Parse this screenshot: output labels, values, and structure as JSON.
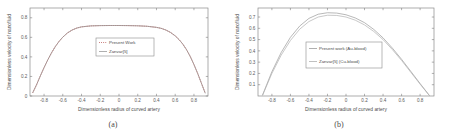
{
  "figure": {
    "panels": [
      {
        "caption": "(a)",
        "xlabel": "Dimensionless radius of curved artery",
        "ylabel": "Dimensionless velocity of nanofluid",
        "xticks": [
          "-0.8",
          "-0.6",
          "-0.4",
          "-0.2",
          "0",
          "0.2",
          "0.4",
          "0.6",
          "0.8"
        ],
        "yticks": [
          "0",
          "0.2",
          "0.4",
          "0.6",
          "0.8"
        ],
        "legend": [
          {
            "label": "Present Work",
            "color": "#b5524f",
            "style": "dotted"
          },
          {
            "label": "Zanvar[5]",
            "color": "#9a9a9a",
            "style": "solid"
          }
        ]
      },
      {
        "caption": "(b)",
        "xlabel": "Dimensionless radius of curved artery",
        "ylabel": "Dimensionless velocity of nanofluid",
        "xticks": [
          "-0.8",
          "-0.6",
          "-0.4",
          "-0.2",
          "0",
          "0.2",
          "0.4",
          "0.6",
          "0.8"
        ],
        "yticks": [
          "0.1",
          "0.2",
          "0.3",
          "0.4",
          "0.5",
          "0.6",
          "0.7"
        ],
        "legend": [
          {
            "label": "Present work (Au-blood)",
            "color": "#9a9a9a",
            "style": "solid"
          },
          {
            "label": "Zanvar[5] (Cu-blood)",
            "color": "#b0b0b0",
            "style": "solid"
          }
        ]
      }
    ]
  },
  "chart_data": [
    {
      "type": "line",
      "title": "",
      "subtitle": "(a)",
      "xlabel": "Dimensionless radius of curved artery",
      "ylabel": "Dimensionless velocity of nanofluid",
      "xlim": [
        -0.95,
        0.95
      ],
      "ylim": [
        0,
        0.9
      ],
      "xticks": [
        -0.8,
        -0.6,
        -0.4,
        -0.2,
        0,
        0.2,
        0.4,
        0.6,
        0.8
      ],
      "yticks": [
        0,
        0.2,
        0.4,
        0.6,
        0.8
      ],
      "grid": false,
      "legend_position": "center",
      "series": [
        {
          "name": "Present Work",
          "color": "#b5524f",
          "linestyle": "dotted",
          "x": [
            -0.92,
            -0.88,
            -0.84,
            -0.8,
            -0.76,
            -0.72,
            -0.68,
            -0.64,
            -0.6,
            -0.55,
            -0.5,
            -0.45,
            -0.4,
            -0.3,
            -0.2,
            -0.1,
            0.0,
            0.1,
            0.2,
            0.3,
            0.4,
            0.45,
            0.5,
            0.55,
            0.6,
            0.64,
            0.68,
            0.72,
            0.76,
            0.8,
            0.84,
            0.88,
            0.92
          ],
          "y": [
            0.035,
            0.115,
            0.205,
            0.29,
            0.37,
            0.442,
            0.505,
            0.558,
            0.602,
            0.645,
            0.675,
            0.695,
            0.707,
            0.717,
            0.72,
            0.721,
            0.721,
            0.72,
            0.718,
            0.713,
            0.702,
            0.692,
            0.675,
            0.65,
            0.615,
            0.578,
            0.532,
            0.475,
            0.405,
            0.322,
            0.23,
            0.13,
            0.03
          ]
        },
        {
          "name": "Zanvar[5]",
          "color": "#9a9a9a",
          "linestyle": "solid",
          "x": [
            -0.92,
            -0.88,
            -0.84,
            -0.8,
            -0.76,
            -0.72,
            -0.68,
            -0.64,
            -0.6,
            -0.55,
            -0.5,
            -0.45,
            -0.4,
            -0.3,
            -0.2,
            -0.1,
            0.0,
            0.1,
            0.2,
            0.3,
            0.4,
            0.45,
            0.5,
            0.55,
            0.6,
            0.64,
            0.68,
            0.72,
            0.76,
            0.8,
            0.84,
            0.88,
            0.92
          ],
          "y": [
            0.035,
            0.115,
            0.205,
            0.29,
            0.37,
            0.442,
            0.505,
            0.558,
            0.602,
            0.645,
            0.675,
            0.695,
            0.707,
            0.717,
            0.72,
            0.721,
            0.721,
            0.72,
            0.718,
            0.713,
            0.702,
            0.692,
            0.675,
            0.65,
            0.615,
            0.578,
            0.532,
            0.475,
            0.405,
            0.322,
            0.23,
            0.13,
            0.03
          ]
        }
      ]
    },
    {
      "type": "line",
      "title": "",
      "subtitle": "(b)",
      "xlabel": "Dimensionless radius of curved artery",
      "ylabel": "Dimensionless velocity of nanofluid",
      "xlim": [
        -0.95,
        0.95
      ],
      "ylim": [
        0,
        0.78
      ],
      "xticks": [
        -0.8,
        -0.6,
        -0.4,
        -0.2,
        0,
        0.2,
        0.4,
        0.6,
        0.8
      ],
      "yticks": [
        0.1,
        0.2,
        0.3,
        0.4,
        0.5,
        0.6,
        0.7
      ],
      "grid": false,
      "legend_position": "center",
      "series": [
        {
          "name": "Present work (Au-blood)",
          "color": "#9a9a9a",
          "linestyle": "solid",
          "x": [
            -0.9,
            -0.8,
            -0.7,
            -0.6,
            -0.5,
            -0.4,
            -0.3,
            -0.2,
            -0.1,
            0.0,
            0.1,
            0.2,
            0.3,
            0.4,
            0.5,
            0.6,
            0.7,
            0.8,
            0.9
          ],
          "y": [
            0.01,
            0.215,
            0.385,
            0.52,
            0.62,
            0.688,
            0.725,
            0.738,
            0.735,
            0.72,
            0.692,
            0.65,
            0.59,
            0.515,
            0.425,
            0.325,
            0.218,
            0.11,
            0.005
          ]
        },
        {
          "name": "Zanvar[5] (Cu-blood)",
          "color": "#b0b0b0",
          "linestyle": "solid",
          "x": [
            -0.9,
            -0.8,
            -0.7,
            -0.6,
            -0.5,
            -0.4,
            -0.3,
            -0.2,
            -0.1,
            0.0,
            0.1,
            0.2,
            0.3,
            0.4,
            0.5,
            0.6,
            0.7,
            0.8,
            0.9
          ],
          "y": [
            0.008,
            0.2,
            0.362,
            0.492,
            0.592,
            0.66,
            0.7,
            0.716,
            0.714,
            0.7,
            0.672,
            0.63,
            0.572,
            0.5,
            0.412,
            0.315,
            0.21,
            0.105,
            0.004
          ]
        }
      ]
    }
  ]
}
